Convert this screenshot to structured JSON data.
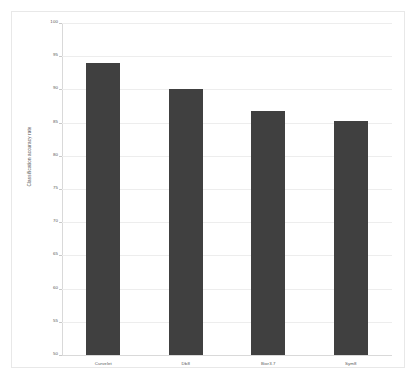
{
  "chart_data": {
    "type": "bar",
    "title": "",
    "xlabel": "",
    "ylabel": "Classification accuracy rate",
    "categories": [
      "Curvelet",
      "Db8",
      "Bior3.7",
      "Sym8"
    ],
    "values": [
      94.0,
      90.0,
      86.7,
      85.3
    ],
    "ylim": [
      50,
      100
    ],
    "ytick_step": 5,
    "yticks": [
      100,
      95,
      90,
      85,
      80,
      75,
      70,
      65,
      60,
      55,
      50
    ],
    "ytick_labels": [
      "100",
      "95",
      "90",
      "85",
      "80",
      "75",
      "70",
      "65",
      "60",
      "55",
      "50"
    ],
    "grid": true,
    "grid_axis": "y",
    "legend": false,
    "legend_position": "none",
    "series": [
      {
        "name": "Classification accuracy rate",
        "values": [
          94.0,
          90.0,
          86.7,
          85.3
        ]
      }
    ]
  },
  "colors": {
    "bar": "#404040",
    "grid": "#ededed",
    "axis": "#d9d9d9",
    "tick_text": "#595959",
    "axis_title": "#4a4a4a",
    "figure_border": "#e8e8e8",
    "background": "#ffffff"
  }
}
